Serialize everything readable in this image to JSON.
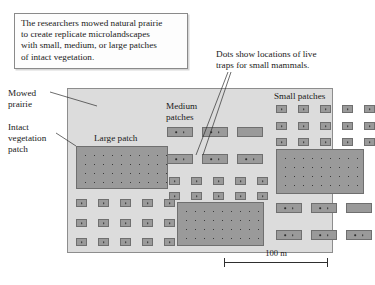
{
  "caption": {
    "lines": [
      "The researchers mowed natural prairie",
      "to create replicate microlandscapes",
      "with small, medium, or large patches",
      "of intact vegetation."
    ]
  },
  "traps_note": {
    "lines": [
      "Dots show locations of live",
      "traps for small mammals."
    ]
  },
  "labels": {
    "mowed_prairie": [
      "Mowed",
      "prairie"
    ],
    "intact_vegetation": [
      "Intact",
      "vegetation",
      "patch"
    ],
    "large_patch": "Large patch",
    "medium_patches": [
      "Medium",
      "patches"
    ],
    "small_patches": "Small patches"
  },
  "scale": {
    "text": "100 m"
  },
  "colors": {
    "map_background": "#dcdcdc",
    "map_border": "#8d8d8d",
    "patch_fill": "#9a9a9a",
    "patch_border": "#6f6f6f",
    "dot": "#2e2e2e",
    "text": "#1a1a1a",
    "caption_background": "#fdfdfd",
    "caption_border": "#8a8a8a"
  },
  "map": {
    "width": 266,
    "height": 165,
    "patch_kinds": {
      "large": "large dotted vegetation patch",
      "medium": "medium vegetation patch with two traps",
      "small": "small vegetation patch with one trap"
    },
    "patches": [
      {
        "kind": "large",
        "x": 8,
        "y": 57,
        "w": 92,
        "h": 43,
        "dots_cols": 10,
        "dots_rows": 5
      },
      {
        "kind": "large",
        "x": 109,
        "y": 113,
        "w": 87,
        "h": 44,
        "dots_cols": 10,
        "dots_rows": 5
      },
      {
        "kind": "large",
        "x": 208,
        "y": 60,
        "w": 88,
        "h": 45,
        "dots_cols": 10,
        "dots_rows": 5
      },
      {
        "kind": "medium",
        "x": 99,
        "y": 38,
        "w": 26,
        "h": 10,
        "traps": 2
      },
      {
        "kind": "medium",
        "x": 134,
        "y": 38,
        "w": 26,
        "h": 10,
        "traps": 2
      },
      {
        "kind": "medium",
        "x": 169,
        "y": 38,
        "w": 26,
        "h": 10,
        "traps": 0
      },
      {
        "kind": "medium",
        "x": 99,
        "y": 65,
        "w": 26,
        "h": 10,
        "traps": 2
      },
      {
        "kind": "medium",
        "x": 134,
        "y": 65,
        "w": 26,
        "h": 10,
        "traps": 2
      },
      {
        "kind": "medium",
        "x": 169,
        "y": 65,
        "w": 26,
        "h": 10,
        "traps": 2
      },
      {
        "kind": "medium",
        "x": 208,
        "y": 114,
        "w": 26,
        "h": 10,
        "traps": 2
      },
      {
        "kind": "medium",
        "x": 243,
        "y": 114,
        "w": 26,
        "h": 10,
        "traps": 2
      },
      {
        "kind": "medium",
        "x": 278,
        "y": 114,
        "w": 26,
        "h": 10,
        "traps": 0
      },
      {
        "kind": "medium",
        "x": 208,
        "y": 141,
        "w": 26,
        "h": 10,
        "traps": 2
      },
      {
        "kind": "medium",
        "x": 243,
        "y": 141,
        "w": 26,
        "h": 10,
        "traps": 2
      },
      {
        "kind": "medium",
        "x": 278,
        "y": 141,
        "w": 26,
        "h": 10,
        "traps": 2
      },
      {
        "kind": "small",
        "x": 8,
        "y": 110,
        "w": 11,
        "h": 8
      },
      {
        "kind": "small",
        "x": 30,
        "y": 110,
        "w": 11,
        "h": 8
      },
      {
        "kind": "small",
        "x": 52,
        "y": 110,
        "w": 11,
        "h": 8
      },
      {
        "kind": "small",
        "x": 74,
        "y": 110,
        "w": 11,
        "h": 8
      },
      {
        "kind": "small",
        "x": 96,
        "y": 110,
        "w": 11,
        "h": 8
      },
      {
        "kind": "small",
        "x": 8,
        "y": 130,
        "w": 11,
        "h": 8
      },
      {
        "kind": "small",
        "x": 30,
        "y": 130,
        "w": 11,
        "h": 8
      },
      {
        "kind": "small",
        "x": 52,
        "y": 130,
        "w": 11,
        "h": 8
      },
      {
        "kind": "small",
        "x": 74,
        "y": 130,
        "w": 11,
        "h": 8
      },
      {
        "kind": "small",
        "x": 96,
        "y": 130,
        "w": 11,
        "h": 8
      },
      {
        "kind": "small",
        "x": 8,
        "y": 149,
        "w": 11,
        "h": 8
      },
      {
        "kind": "small",
        "x": 30,
        "y": 149,
        "w": 11,
        "h": 8
      },
      {
        "kind": "small",
        "x": 52,
        "y": 149,
        "w": 11,
        "h": 8
      },
      {
        "kind": "small",
        "x": 74,
        "y": 149,
        "w": 11,
        "h": 8
      },
      {
        "kind": "small",
        "x": 96,
        "y": 149,
        "w": 11,
        "h": 8
      },
      {
        "kind": "small",
        "x": 101,
        "y": 88,
        "w": 11,
        "h": 8
      },
      {
        "kind": "small",
        "x": 123,
        "y": 88,
        "w": 11,
        "h": 8
      },
      {
        "kind": "small",
        "x": 145,
        "y": 88,
        "w": 11,
        "h": 8
      },
      {
        "kind": "small",
        "x": 167,
        "y": 88,
        "w": 11,
        "h": 8
      },
      {
        "kind": "small",
        "x": 189,
        "y": 88,
        "w": 11,
        "h": 8
      },
      {
        "kind": "small",
        "x": 101,
        "y": 103,
        "w": 11,
        "h": 8
      },
      {
        "kind": "small",
        "x": 123,
        "y": 103,
        "w": 11,
        "h": 8
      },
      {
        "kind": "small",
        "x": 145,
        "y": 103,
        "w": 11,
        "h": 8
      },
      {
        "kind": "small",
        "x": 167,
        "y": 103,
        "w": 11,
        "h": 8
      },
      {
        "kind": "small",
        "x": 189,
        "y": 103,
        "w": 11,
        "h": 8
      },
      {
        "kind": "small",
        "x": 208,
        "y": 16,
        "w": 11,
        "h": 8
      },
      {
        "kind": "small",
        "x": 230,
        "y": 16,
        "w": 11,
        "h": 8
      },
      {
        "kind": "small",
        "x": 252,
        "y": 16,
        "w": 11,
        "h": 8
      },
      {
        "kind": "small",
        "x": 274,
        "y": 16,
        "w": 11,
        "h": 8
      },
      {
        "kind": "small",
        "x": 296,
        "y": 16,
        "w": 11,
        "h": 8
      },
      {
        "kind": "small",
        "x": 208,
        "y": 33,
        "w": 11,
        "h": 8
      },
      {
        "kind": "small",
        "x": 230,
        "y": 33,
        "w": 11,
        "h": 8
      },
      {
        "kind": "small",
        "x": 252,
        "y": 33,
        "w": 11,
        "h": 8
      },
      {
        "kind": "small",
        "x": 274,
        "y": 33,
        "w": 11,
        "h": 8
      },
      {
        "kind": "small",
        "x": 296,
        "y": 33,
        "w": 11,
        "h": 8
      },
      {
        "kind": "small",
        "x": 208,
        "y": 49,
        "w": 11,
        "h": 8
      },
      {
        "kind": "small",
        "x": 230,
        "y": 49,
        "w": 11,
        "h": 8
      },
      {
        "kind": "small",
        "x": 252,
        "y": 49,
        "w": 11,
        "h": 8
      },
      {
        "kind": "small",
        "x": 274,
        "y": 49,
        "w": 11,
        "h": 8
      },
      {
        "kind": "small",
        "x": 296,
        "y": 49,
        "w": 11,
        "h": 8
      }
    ]
  }
}
